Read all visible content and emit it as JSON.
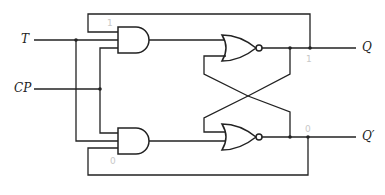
{
  "inputs": [
    {
      "name": "T",
      "label": "T"
    },
    {
      "name": "CP",
      "label": "CP"
    }
  ],
  "outputs": [
    {
      "name": "Q",
      "label": "Q"
    },
    {
      "name": "Q_prime",
      "label": "Q′"
    }
  ],
  "gates": [
    {
      "id": "and-top",
      "type": "AND",
      "inputs": [
        "Q'(feedback)",
        "T",
        "CP"
      ]
    },
    {
      "id": "and-bottom",
      "type": "AND",
      "inputs": [
        "CP",
        "T",
        "Q(feedback)"
      ]
    },
    {
      "id": "nor-top",
      "type": "NOR",
      "inputs": [
        "and-top",
        "nor-bottom"
      ],
      "output": "Q"
    },
    {
      "id": "nor-bottom",
      "type": "NOR",
      "inputs": [
        "nor-top",
        "and-bottom"
      ],
      "output": "Q'"
    }
  ],
  "annotations": {
    "top_and_pencil": "1",
    "q_pencil": "1",
    "bottom_and_pencil": "0",
    "qprime_pencil": "0"
  },
  "colors": {
    "line": "#222222",
    "pencil": "#c8c8c8",
    "background": "#ffffff"
  }
}
